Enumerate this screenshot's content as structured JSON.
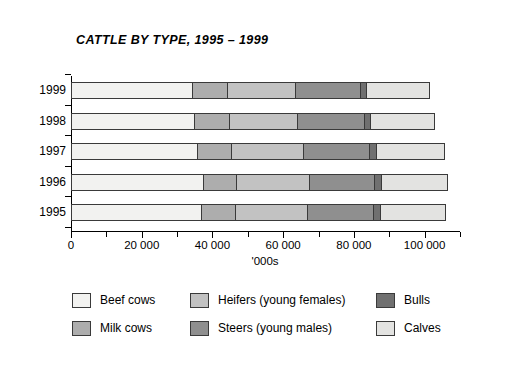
{
  "chart_data": {
    "type": "bar",
    "orientation": "horizontal",
    "stacked": true,
    "title": "CATTLE BY TYPE, 1995 – 1999",
    "xlabel": "'000s",
    "ylabel": "",
    "xlim": [
      0,
      110000
    ],
    "xticks": [
      0,
      10000,
      20000,
      30000,
      40000,
      50000,
      60000,
      70000,
      80000,
      90000,
      100000,
      110000
    ],
    "xtick_labels": [
      "0",
      "",
      "20 000",
      "",
      "40 000",
      "",
      "60 000",
      "",
      "80 000",
      "",
      "100 000",
      ""
    ],
    "grid": false,
    "legend_position": "bottom",
    "categories": [
      "1995",
      "1996",
      "1997",
      "1998",
      "1999"
    ],
    "categories_display_order": [
      "1999",
      "1998",
      "1997",
      "1996",
      "1995"
    ],
    "series": [
      {
        "name": "Beef cows",
        "color": "#f2f2f0",
        "values": [
          37000,
          37500,
          36000,
          35000,
          34500
        ]
      },
      {
        "name": "Milk cows",
        "color": "#adadad",
        "values": [
          10000,
          9700,
          9700,
          10200,
          10200
        ]
      },
      {
        "name": "Heifers (young females)",
        "color": "#c2c2c2",
        "values": [
          20500,
          21000,
          20700,
          19600,
          19500
        ]
      },
      {
        "name": "Steers (young males)",
        "color": "#8f8f8f",
        "values": [
          19000,
          18700,
          19000,
          19300,
          18700
        ]
      },
      {
        "name": "Bulls",
        "color": "#707070",
        "values": [
          2200,
          2300,
          2300,
          2000,
          1800
        ]
      },
      {
        "name": "Calves",
        "color": "#e3e3e1",
        "values": [
          18700,
          18700,
          19400,
          18300,
          18300
        ]
      }
    ],
    "totals": [
      107400,
      107900,
      107100,
      104400,
      103000
    ],
    "annotations": []
  },
  "legend": {
    "items": [
      {
        "label": "Beef cows",
        "color": "#f2f2f0"
      },
      {
        "label": "Heifers (young females)",
        "color": "#c2c2c2"
      },
      {
        "label": "Bulls",
        "color": "#707070"
      },
      {
        "label": "Milk cows",
        "color": "#adadad"
      },
      {
        "label": "Steers (young males)",
        "color": "#8f8f8f"
      },
      {
        "label": "Calves",
        "color": "#e3e3e1"
      }
    ]
  },
  "colors": {
    "axis": "#000000",
    "segment_border": "#3a3a3a",
    "background": "#ffffff"
  }
}
